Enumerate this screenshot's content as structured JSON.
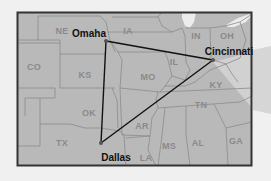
{
  "map": {
    "type": "regional-us-map",
    "colors": {
      "background": "#f0f0f0",
      "land": "#b9b9b9",
      "border": "#333333",
      "state_lines": "#8c8c8c",
      "lakes": "#ececec",
      "route": "#111111",
      "callout": "#dcdcdc"
    },
    "states": [
      {
        "abbr": "NE",
        "x": 62,
        "y": 31
      },
      {
        "abbr": "IA",
        "x": 128,
        "y": 31
      },
      {
        "abbr": "IN",
        "x": 196,
        "y": 36
      },
      {
        "abbr": "OH",
        "x": 227,
        "y": 36
      },
      {
        "abbr": "CO",
        "x": 34,
        "y": 67
      },
      {
        "abbr": "KS",
        "x": 85,
        "y": 75
      },
      {
        "abbr": "MO",
        "x": 148,
        "y": 77
      },
      {
        "abbr": "IL",
        "x": 174,
        "y": 62
      },
      {
        "abbr": "KY",
        "x": 216,
        "y": 85
      },
      {
        "abbr": "OK",
        "x": 89,
        "y": 113
      },
      {
        "abbr": "TN",
        "x": 201,
        "y": 105
      },
      {
        "abbr": "AR",
        "x": 142,
        "y": 126
      },
      {
        "abbr": "TX",
        "x": 62,
        "y": 143
      },
      {
        "abbr": "LA",
        "x": 146,
        "y": 158
      },
      {
        "abbr": "MS",
        "x": 169,
        "y": 146
      },
      {
        "abbr": "AL",
        "x": 198,
        "y": 143
      },
      {
        "abbr": "GA",
        "x": 236,
        "y": 141
      }
    ],
    "cities": [
      {
        "name": "Omaha",
        "point": [
          106,
          41
        ],
        "label_x": 89,
        "label_y": 33
      },
      {
        "name": "Cincinnati",
        "point": [
          213,
          60
        ],
        "label_x": 229,
        "label_y": 51
      },
      {
        "name": "Dallas",
        "point": [
          101,
          143
        ],
        "label_x": 116,
        "label_y": 157
      }
    ],
    "route": {
      "shape": "triangle",
      "vertices": [
        "Omaha",
        "Cincinnati",
        "Dallas"
      ]
    }
  }
}
